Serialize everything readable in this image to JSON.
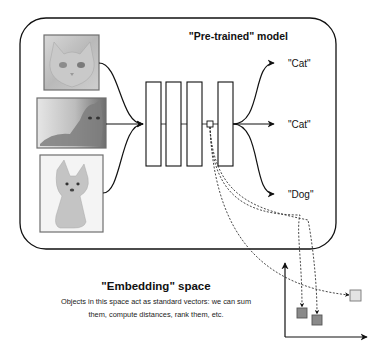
{
  "model": {
    "title": "\"Pre-trained\" model",
    "inputs": [
      {
        "name": "cat-image-1",
        "subject": "cat",
        "description": "close-up of orange cat face"
      },
      {
        "name": "cat-image-2",
        "subject": "cat",
        "description": "tabby cat lying down"
      },
      {
        "name": "dog-image",
        "subject": "dog",
        "description": "corgi puppy sitting"
      }
    ],
    "layers": 4,
    "outputs": [
      "\"Cat\"",
      "\"Cat\"",
      "\"Dog\""
    ]
  },
  "embedding": {
    "title": "\"Embedding\" space",
    "description_line1": "Objects in this space act as standard vectors: we can sum",
    "description_line2": "them, compute distances, rank them, etc.",
    "points": [
      {
        "name": "cat-1-embedding",
        "shade": "dark",
        "color": "#8a8a8a"
      },
      {
        "name": "cat-2-embedding",
        "shade": "dark",
        "color": "#8a8a8a"
      },
      {
        "name": "dog-embedding",
        "shade": "light",
        "color": "#e4e4e4"
      }
    ]
  },
  "colors": {
    "stroke": "#111111",
    "image_border": "#6e6e6e",
    "dark_point": "#8a8a8a",
    "light_point": "#e4e4e4"
  }
}
